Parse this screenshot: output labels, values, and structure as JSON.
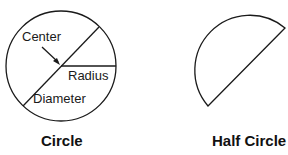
{
  "diagram": {
    "circle": {
      "title": "Circle",
      "labels": {
        "center": "Center",
        "radius": "Radius",
        "diameter": "Diameter"
      }
    },
    "half_circle": {
      "title": "Half Circle"
    },
    "colors": {
      "stroke": "#1a1a1a",
      "background": "#ffffff"
    }
  }
}
